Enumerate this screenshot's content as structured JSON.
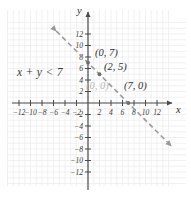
{
  "chart_data": {
    "type": "line",
    "title": "",
    "xlabel": "x",
    "ylabel": "y",
    "xlim": [
      -14,
      14
    ],
    "ylim": [
      -14,
      14
    ],
    "grid": true,
    "legend": null,
    "line_equation": "x + y = 7",
    "line_style": "dashed",
    "line_color": "#9a9a9a",
    "inequality": "x + y < 7",
    "x_ticks": [
      -12,
      -10,
      -8,
      -6,
      -4,
      -2,
      2,
      4,
      6,
      8,
      10,
      12
    ],
    "y_ticks": [
      -12,
      -10,
      -8,
      -6,
      -4,
      -2,
      2,
      4,
      6,
      8,
      10,
      12
    ],
    "x_tick_labels": [
      "-12",
      "-10",
      "-8",
      "-6",
      "-4",
      "-2",
      "2",
      "4",
      "6",
      "8",
      "10",
      "12"
    ],
    "y_tick_labels": [
      "-12",
      "-10",
      "-8",
      "-6",
      "-4",
      "-2",
      "2",
      "4",
      "6",
      "8",
      "10",
      "12"
    ],
    "points": [
      {
        "x": 0,
        "y": 7,
        "label": "(0, 7)",
        "color": "#2e2e2e",
        "marker": true
      },
      {
        "x": 2,
        "y": 5,
        "label": "(2, 5)",
        "color": "#2e2e2e",
        "marker": true
      },
      {
        "x": 0,
        "y": 0,
        "label": "(0, 0)",
        "color": "#b9b9b9",
        "marker": false
      },
      {
        "x": 7,
        "y": 0,
        "label": "(7, 0)",
        "color": "#2e2e2e",
        "marker": true
      }
    ],
    "line_endpoints": [
      {
        "x": -5.5,
        "y": 12.5
      },
      {
        "x": 14.5,
        "y": -7.5
      }
    ]
  },
  "annotations": {
    "inequality": "x + y < 7",
    "point_label_1": "(0, 7)",
    "point_label_2": "(2, 5)",
    "point_label_3": "(0, 0)",
    "point_label_4": "(7, 0)",
    "x_axis_name": "x",
    "y_axis_name": "y"
  },
  "colors": {
    "grid": "#ededed",
    "axis": "#4a4a4a",
    "line": "#9a9a9a",
    "text": "#2e2e2e",
    "muted_text": "#b9b9b9",
    "background": "#ffffff"
  },
  "axis_tick_labels": {
    "x_neg": [
      "-12",
      "-10",
      "-8",
      "-6",
      "-4",
      "-2"
    ],
    "x_pos": [
      "2",
      "4",
      "6",
      "8",
      "10",
      "12"
    ],
    "y_pos": [
      "2",
      "4",
      "6",
      "8",
      "10",
      "12"
    ],
    "y_neg": [
      "-2",
      "-4",
      "-6",
      "-8",
      "-10",
      "-12"
    ]
  }
}
